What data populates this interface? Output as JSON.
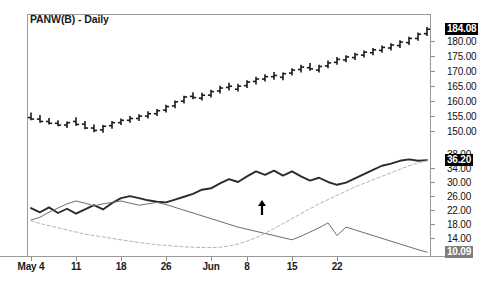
{
  "header": {
    "title": "PANW(B) - Daily"
  },
  "colors": {
    "background": "#ffffff",
    "frame": "#9a9a9a",
    "price_bars": "#1a1a1a",
    "indicator_thick": "#2b2b2b",
    "indicator_thin": "#6e6e6e",
    "indicator_dashed": "#b4b4b4",
    "label_highlight_dark": "#000000",
    "label_highlight_gray": "#7d7d7d",
    "arrow_marker": "#000000"
  },
  "price_axis": {
    "labels": [
      "184.08",
      "180.00",
      "175.00",
      "170.00",
      "165.00",
      "160.00",
      "155.00",
      "150.00"
    ],
    "highlighted_label": "184.08",
    "highlight_style": "dark"
  },
  "indicator_axis": {
    "labels": [
      "38.00",
      "36.20",
      "34.00",
      "30.00",
      "26.00",
      "22.00",
      "18.00",
      "14.00",
      "10.09"
    ],
    "highlighted_labels": [
      "36.20",
      "10.09"
    ],
    "clipped_label": "38.00"
  },
  "x_axis": {
    "labels": [
      "May 4",
      "11",
      "18",
      "26",
      "Jun",
      "8",
      "15",
      "22"
    ]
  },
  "annotations": [
    {
      "name": "buy-arrow-marker",
      "glyph": "up-arrow",
      "x": 262,
      "y": 211
    }
  ],
  "chart_data": {
    "type": "line",
    "title": "PANW(B) - Daily",
    "subtitle": "",
    "xlabel": "",
    "ylabel": "",
    "grid": false,
    "legend_position": "none",
    "panels": [
      {
        "name": "price-panel",
        "type": "ohlc",
        "ylim": [
          147.0,
          186.5
        ],
        "ytick_values": [
          180.0,
          175.0,
          170.0,
          165.0,
          160.0,
          155.0,
          150.0
        ],
        "last_value": 184.08,
        "x_categories": [
          "May 4",
          "May 5",
          "May 6",
          "May 7",
          "May 8",
          "May 11",
          "May 12",
          "May 13",
          "May 14",
          "May 15",
          "May 18",
          "May 19",
          "May 20",
          "May 21",
          "May 22",
          "May 26",
          "May 27",
          "May 28",
          "May 29",
          "Jun 1",
          "Jun 2",
          "Jun 3",
          "Jun 4",
          "Jun 5",
          "Jun 8",
          "Jun 9",
          "Jun 10",
          "Jun 11",
          "Jun 12",
          "Jun 15",
          "Jun 16",
          "Jun 17",
          "Jun 18",
          "Jun 19",
          "Jun 22",
          "Jun 23",
          "Jun 24",
          "Jun 25",
          "Jun 26",
          "Jun 29",
          "Jun 30",
          "Jul 1",
          "Jul 2",
          "Jul 6",
          "Jul 7"
        ],
        "open": [
          154.5,
          154.0,
          153.2,
          152.6,
          152.0,
          153.2,
          152.3,
          151.0,
          150.4,
          151.8,
          152.8,
          153.6,
          154.2,
          155.0,
          155.8,
          157.0,
          158.4,
          160.0,
          161.6,
          161.0,
          162.0,
          163.4,
          164.6,
          164.0,
          165.2,
          166.6,
          167.4,
          168.2,
          168.0,
          169.4,
          170.6,
          171.2,
          170.4,
          171.8,
          173.0,
          173.8,
          174.6,
          175.4,
          176.2,
          177.0,
          177.8,
          178.6,
          179.6,
          181.0,
          182.6
        ],
        "high": [
          156.2,
          155.4,
          154.4,
          153.6,
          153.2,
          154.6,
          153.4,
          152.2,
          152.0,
          153.4,
          154.2,
          155.0,
          155.6,
          156.6,
          157.4,
          158.8,
          160.2,
          161.8,
          163.0,
          162.8,
          163.8,
          165.2,
          166.2,
          165.8,
          167.0,
          168.2,
          169.0,
          169.8,
          169.6,
          171.0,
          172.2,
          172.8,
          172.2,
          173.6,
          174.8,
          175.4,
          176.2,
          177.0,
          177.8,
          178.6,
          179.4,
          180.4,
          181.6,
          183.0,
          184.8
        ],
        "low": [
          153.6,
          152.8,
          152.2,
          151.6,
          151.0,
          151.8,
          150.6,
          149.6,
          149.4,
          150.8,
          152.0,
          152.8,
          153.4,
          154.2,
          155.0,
          156.2,
          157.6,
          159.2,
          160.6,
          160.2,
          161.2,
          162.6,
          163.6,
          163.2,
          164.4,
          165.6,
          166.6,
          167.2,
          167.0,
          168.6,
          169.6,
          170.2,
          169.6,
          171.0,
          172.2,
          173.0,
          173.8,
          174.6,
          175.4,
          176.2,
          177.0,
          177.8,
          178.8,
          180.2,
          181.8
        ],
        "close": [
          154.0,
          153.2,
          152.6,
          152.0,
          152.8,
          152.2,
          151.0,
          150.2,
          151.6,
          152.8,
          153.6,
          154.2,
          155.0,
          155.8,
          156.8,
          158.2,
          159.8,
          161.4,
          161.2,
          162.0,
          163.2,
          164.4,
          165.0,
          165.0,
          166.4,
          167.4,
          168.2,
          168.6,
          169.2,
          170.4,
          171.4,
          170.8,
          171.6,
          172.8,
          174.0,
          174.8,
          175.6,
          176.4,
          177.2,
          178.0,
          178.8,
          179.8,
          181.0,
          182.4,
          184.08
        ]
      },
      {
        "name": "indicator-panel",
        "type": "line",
        "ylim": [
          9.0,
          38.5
        ],
        "ytick_values": [
          34.0,
          30.0,
          26.0,
          22.0,
          18.0,
          14.0
        ],
        "series": [
          {
            "name": "indicator-thick",
            "style": "solid-thick",
            "color": "#2b2b2b",
            "last_value": 36.2,
            "values": [
              22.6,
              21.4,
              22.8,
              21.2,
              22.4,
              21.0,
              22.2,
              23.4,
              22.2,
              24.0,
              25.4,
              26.0,
              25.4,
              24.8,
              24.4,
              24.2,
              25.0,
              25.8,
              26.6,
              27.8,
              28.2,
              29.6,
              30.8,
              30.0,
              31.6,
              33.0,
              32.0,
              33.2,
              31.8,
              33.0,
              31.6,
              30.4,
              31.2,
              30.0,
              29.2,
              29.8,
              31.0,
              32.2,
              33.4,
              34.6,
              35.2,
              36.0,
              36.4,
              36.0,
              36.2
            ]
          },
          {
            "name": "indicator-thin",
            "style": "solid-thin",
            "color": "#6e6e6e",
            "last_value": 10.09,
            "values": [
              19.2,
              20.0,
              21.4,
              22.6,
              23.8,
              24.6,
              24.0,
              23.2,
              23.8,
              24.2,
              24.6,
              24.0,
              23.4,
              23.8,
              24.2,
              23.6,
              22.8,
              22.0,
              21.2,
              20.4,
              19.6,
              18.8,
              18.0,
              17.2,
              16.6,
              16.0,
              15.4,
              14.8,
              14.2,
              13.6,
              14.6,
              15.8,
              17.0,
              18.4,
              14.8,
              17.2,
              16.4,
              15.6,
              14.8,
              14.0,
              13.2,
              12.4,
              11.6,
              10.8,
              10.09
            ]
          },
          {
            "name": "indicator-dashed",
            "style": "dashed",
            "color": "#b4b4b4",
            "values": [
              19.0,
              18.2,
              17.6,
              17.0,
              16.4,
              15.8,
              15.2,
              14.8,
              14.4,
              14.0,
              13.6,
              13.2,
              12.8,
              12.5,
              12.2,
              12.0,
              11.8,
              11.6,
              11.5,
              11.4,
              11.4,
              11.5,
              11.8,
              12.4,
              13.2,
              14.2,
              15.4,
              16.8,
              18.2,
              19.6,
              21.0,
              22.4,
              23.8,
              25.0,
              26.2,
              27.4,
              28.6,
              29.6,
              30.6,
              31.6,
              32.6,
              33.6,
              34.6,
              35.4,
              36.0
            ]
          }
        ]
      }
    ]
  }
}
